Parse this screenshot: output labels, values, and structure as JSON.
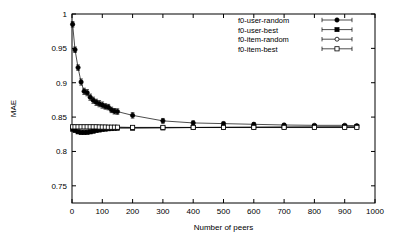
{
  "chart_data": {
    "type": "line",
    "title": "",
    "xlabel": "Number of peers",
    "ylabel": "MAE",
    "xlim": [
      0,
      1000
    ],
    "ylim": [
      0.725,
      1.0
    ],
    "grid": false,
    "legend_position": "top-right",
    "xticks": [
      "0",
      "100",
      "200",
      "300",
      "400",
      "500",
      "600",
      "700",
      "800",
      "900",
      "1000"
    ],
    "xtick_values": [
      0,
      100,
      200,
      300,
      400,
      500,
      600,
      700,
      800,
      900,
      1000
    ],
    "yticks": [
      "0.75",
      "0.8",
      "0.85",
      "0.9",
      "0.95",
      "1"
    ],
    "ytick_values": [
      0.75,
      0.8,
      0.85,
      0.9,
      0.95,
      1.0
    ],
    "series": [
      {
        "name": "f0-user-random",
        "marker": "filled-circle",
        "x": [
          2,
          10,
          20,
          30,
          40,
          50,
          60,
          70,
          80,
          90,
          100,
          110,
          120,
          130,
          140,
          150,
          200,
          300,
          400,
          500,
          600,
          700,
          800,
          900,
          940
        ],
        "values": [
          0.985,
          0.948,
          0.922,
          0.901,
          0.8875,
          0.8855,
          0.879,
          0.8745,
          0.8715,
          0.8695,
          0.8675,
          0.8655,
          0.8645,
          0.8605,
          0.8585,
          0.858,
          0.8525,
          0.8445,
          0.8415,
          0.8405,
          0.8395,
          0.8385,
          0.838,
          0.838,
          0.8375
        ],
        "err": [
          0.004,
          0.004,
          0.004,
          0.0045,
          0.0045,
          0.0045,
          0.0045,
          0.0045,
          0.0045,
          0.0045,
          0.0045,
          0.004,
          0.004,
          0.004,
          0.004,
          0.004,
          0.004,
          0.0035,
          0.003,
          0.0025,
          0.002,
          0.002,
          0.0015,
          0.0015,
          0.0015
        ]
      },
      {
        "name": "f0-user-best",
        "marker": "filled-square",
        "x": [
          2,
          10,
          20,
          30,
          40,
          50,
          60,
          70,
          80,
          90,
          100,
          110,
          120,
          130,
          140,
          150,
          200,
          300,
          400,
          500,
          600,
          700,
          800,
          900,
          940
        ],
        "values": [
          0.8325,
          0.8305,
          0.8285,
          0.8275,
          0.8275,
          0.8278,
          0.8285,
          0.8295,
          0.8305,
          0.8312,
          0.832,
          0.8325,
          0.833,
          0.8332,
          0.8335,
          0.8338,
          0.8338,
          0.8342,
          0.8348,
          0.8352,
          0.8355,
          0.8358,
          0.836,
          0.8362,
          0.8362
        ],
        "err": [
          0.0025,
          0.0022,
          0.002,
          0.002,
          0.002,
          0.002,
          0.002,
          0.002,
          0.002,
          0.002,
          0.002,
          0.0018,
          0.0018,
          0.0018,
          0.0018,
          0.0018,
          0.0016,
          0.0014,
          0.0012,
          0.001,
          0.001,
          0.001,
          0.001,
          0.001,
          0.001
        ]
      },
      {
        "name": "f0-item-random",
        "marker": "open-circle",
        "x": [
          2,
          10,
          20,
          30,
          40,
          50,
          60,
          70,
          80,
          90,
          100,
          110,
          120,
          130,
          140,
          150,
          200,
          300,
          400,
          500,
          600,
          700,
          800,
          900,
          940
        ],
        "values": [
          0.8355,
          0.8355,
          0.8355,
          0.8355,
          0.8355,
          0.8355,
          0.8355,
          0.8355,
          0.8355,
          0.8353,
          0.8352,
          0.8352,
          0.835,
          0.835,
          0.835,
          0.835,
          0.8348,
          0.8348,
          0.8348,
          0.8348,
          0.8348,
          0.8348,
          0.8348,
          0.8348,
          0.8348
        ],
        "err": [
          0.0022,
          0.002,
          0.002,
          0.002,
          0.002,
          0.002,
          0.002,
          0.002,
          0.002,
          0.002,
          0.002,
          0.0018,
          0.0018,
          0.0018,
          0.0018,
          0.0018,
          0.0016,
          0.0014,
          0.0012,
          0.001,
          0.001,
          0.001,
          0.001,
          0.001,
          0.001
        ]
      },
      {
        "name": "f0-item-best",
        "marker": "open-square",
        "x": [
          2,
          10,
          20,
          30,
          40,
          50,
          60,
          70,
          80,
          90,
          100,
          110,
          120,
          130,
          140,
          150,
          200,
          300,
          400,
          500,
          600,
          700,
          800,
          900,
          940
        ],
        "values": [
          0.8358,
          0.8358,
          0.8358,
          0.8358,
          0.8358,
          0.8358,
          0.8358,
          0.8358,
          0.8358,
          0.8356,
          0.8355,
          0.8355,
          0.8353,
          0.8353,
          0.8353,
          0.8353,
          0.835,
          0.835,
          0.835,
          0.835,
          0.835,
          0.835,
          0.835,
          0.835,
          0.835
        ],
        "err": [
          0.0022,
          0.002,
          0.002,
          0.002,
          0.002,
          0.002,
          0.002,
          0.002,
          0.002,
          0.002,
          0.002,
          0.0018,
          0.0018,
          0.0018,
          0.0018,
          0.0018,
          0.0016,
          0.0014,
          0.0012,
          0.001,
          0.001,
          0.001,
          0.001,
          0.001,
          0.001
        ]
      }
    ],
    "colors": {
      "axis": "#000000",
      "series": "#000000",
      "background": "#ffffff"
    }
  }
}
